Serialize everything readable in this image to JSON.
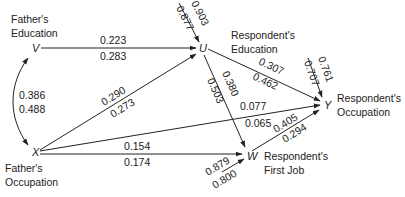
{
  "nodes": {
    "V": {
      "symbol": "V",
      "label_line1": "Father's",
      "label_line2": "Education"
    },
    "X": {
      "symbol": "X",
      "label_line1": "Father's",
      "label_line2": "Occupation"
    },
    "U": {
      "symbol": "U",
      "label_line1": "Respondent's",
      "label_line2": "Education"
    },
    "W": {
      "symbol": "W",
      "label_line1": "Respondent's",
      "label_line2": "First Job"
    },
    "Y": {
      "symbol": "Y",
      "label_line1": "Respondent's",
      "label_line2": "Occupation"
    }
  },
  "edges": {
    "V_U": {
      "from": "V",
      "to": "U",
      "upper": "0.223",
      "lower": "0.283"
    },
    "V_X": {
      "from": "V",
      "to": "X",
      "type": "correlation",
      "upper": "0.386",
      "lower": "0.488"
    },
    "X_U": {
      "from": "X",
      "to": "U",
      "upper": "0.290",
      "lower": "0.273"
    },
    "X_Y": {
      "from": "X",
      "to": "Y",
      "upper": "0.077",
      "lower": "0.065"
    },
    "X_W": {
      "from": "X",
      "to": "W",
      "upper": "0.154",
      "lower": "0.174"
    },
    "U_Y": {
      "from": "U",
      "to": "Y",
      "upper": "0.307",
      "lower": "0.462"
    },
    "U_W": {
      "from": "U",
      "to": "W",
      "upper": "0.380",
      "lower": "0.503"
    },
    "W_Y": {
      "from": "W",
      "to": "Y",
      "upper": "0.405",
      "lower": "0.294"
    },
    "res_U": {
      "to": "U",
      "type": "residual",
      "upper": "0.903",
      "lower": "0.877"
    },
    "res_Y": {
      "to": "Y",
      "type": "residual",
      "upper": "0.761",
      "lower": "0.707"
    },
    "res_W": {
      "to": "W",
      "type": "residual",
      "upper": "0.879",
      "lower": "0.800"
    }
  }
}
